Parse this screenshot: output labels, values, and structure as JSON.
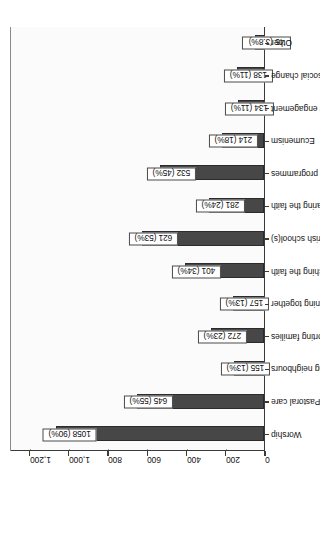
{
  "chart_data": {
    "type": "bar",
    "title": "",
    "subtitle": "",
    "xlabel": "",
    "ylabel": "",
    "orientation": "vertical-rotated",
    "grid": true,
    "legend": false,
    "ylim": [
      0,
      1300
    ],
    "tick_labels": [
      "0",
      "200",
      "400",
      "600",
      "800",
      "1,000",
      "1,200"
    ],
    "tick_values": [
      0,
      200,
      400,
      600,
      800,
      1000,
      1200
    ],
    "categories": [
      "Worship",
      "Pastoral care",
      "Serving neighbours",
      "Supporting families",
      "Learning together",
      "Teaching the faith",
      "Parish school(s)",
      "Sharing the faith",
      "Sacramental programmes",
      "Ecumenism",
      "Community engagement",
      "Confronting injustice/ working for social change",
      "Other"
    ],
    "values": [
      1058,
      645,
      155,
      272,
      157,
      401,
      621,
      281,
      532,
      214,
      134,
      138,
      45
    ],
    "percent_labels": [
      "90%",
      "55%",
      "13%",
      "23%",
      "13%",
      "34%",
      "53%",
      "24%",
      "45%",
      "18%",
      "11%",
      "11%",
      "3.8%"
    ],
    "data_labels": [
      "1058 (90%)",
      "645 (55%)",
      "155 (13%)",
      "272 (23%)",
      "157 (13%)",
      "401 (34%)",
      "621 (53%)",
      "281 (24%)",
      "532 (45%)",
      "214 (18%)",
      "134 (11%)",
      "138 (11%)",
      "45 (3.8%)"
    ],
    "colors": {
      "bar_fill": "#474747",
      "bar_edge": "#2b2b2b",
      "grid": "#9a9a9a",
      "axis": "#3a3a3a",
      "label_box_bg": "#ffffff",
      "label_box_border": "#4a4a4a",
      "plot_bg": "#fbfbfb",
      "text": "#111111"
    }
  }
}
